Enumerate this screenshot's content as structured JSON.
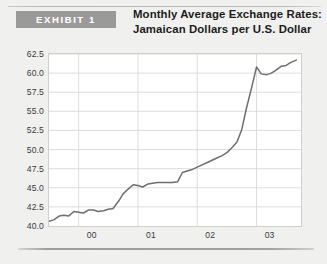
{
  "exhibit": {
    "badge_label": "EXHIBIT 1",
    "badge_color": "#9a9a9a",
    "title_line1": "Monthly Average Exchange Rates:",
    "title_line2": "Jamaican Dollars per U.S. Dollar"
  },
  "chart_data": {
    "type": "line",
    "title": "Monthly Average Exchange Rates: Jamaican Dollars per U.S. Dollar",
    "xlabel": "",
    "ylabel": "",
    "grid": true,
    "legend": false,
    "line_color": "#6e6e6e",
    "plot_background": "#ffffff",
    "grid_color": "#d9d9d9",
    "ylim": [
      40.0,
      62.5
    ],
    "yticks": [
      "40.0",
      "42.5",
      "45.0",
      "47.5",
      "50.0",
      "52.5",
      "55.0",
      "57.5",
      "60.0",
      "62.5"
    ],
    "ytick_values": [
      40.0,
      42.5,
      45.0,
      47.5,
      50.0,
      52.5,
      55.0,
      57.5,
      60.0,
      62.5
    ],
    "xticks": [
      "00",
      "01",
      "02",
      "03"
    ],
    "xtick_values": [
      2000,
      2001,
      2002,
      2003
    ],
    "xlim": [
      1999.5,
      2003.75
    ],
    "x": [
      1999.5,
      1999.58,
      1999.67,
      1999.75,
      1999.83,
      1999.92,
      2000.0,
      2000.08,
      2000.17,
      2000.25,
      2000.33,
      2000.42,
      2000.5,
      2000.58,
      2000.67,
      2000.75,
      2000.83,
      2000.92,
      2001.0,
      2001.08,
      2001.17,
      2001.25,
      2001.33,
      2001.42,
      2001.5,
      2001.58,
      2001.67,
      2001.75,
      2001.83,
      2001.92,
      2002.0,
      2002.08,
      2002.17,
      2002.25,
      2002.33,
      2002.42,
      2002.5,
      2002.58,
      2002.67,
      2002.75,
      2002.83,
      2002.92,
      2003.0,
      2003.08,
      2003.17,
      2003.25,
      2003.33,
      2003.42,
      2003.5,
      2003.58,
      2003.67
    ],
    "values": [
      40.6,
      40.8,
      41.3,
      41.4,
      41.3,
      41.9,
      41.8,
      41.7,
      42.1,
      42.1,
      41.9,
      42.0,
      42.2,
      42.3,
      43.2,
      44.2,
      44.8,
      45.4,
      45.3,
      45.1,
      45.5,
      45.6,
      45.7,
      45.7,
      45.7,
      45.7,
      45.8,
      47.0,
      47.2,
      47.4,
      47.7,
      48.0,
      48.3,
      48.6,
      48.9,
      49.2,
      49.6,
      50.2,
      51.0,
      52.6,
      55.4,
      58.2,
      60.8,
      59.9,
      59.8,
      60.0,
      60.4,
      60.9,
      61.0,
      61.4,
      61.7
    ]
  }
}
